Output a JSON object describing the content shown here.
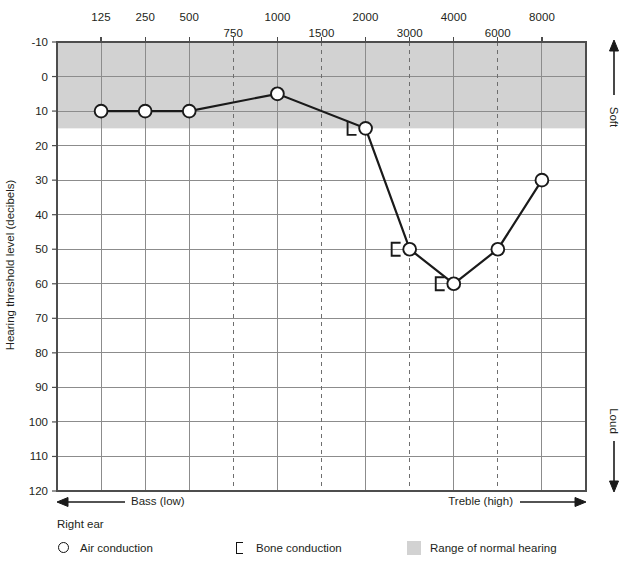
{
  "chart_data": {
    "type": "line",
    "title": "",
    "xlabel": "",
    "ylabel": "Hearing threshold level (decibels)",
    "x_tick_labels_major": [
      "125",
      "250",
      "500",
      "1000",
      "2000",
      "4000",
      "8000"
    ],
    "x_tick_labels_minor": [
      "750",
      "1500",
      "3000",
      "6000"
    ],
    "x_frequencies": [
      125,
      250,
      500,
      750,
      1000,
      1500,
      2000,
      3000,
      4000,
      6000,
      8000
    ],
    "y_tick_labels": [
      "-10",
      "0",
      "10",
      "20",
      "30",
      "40",
      "50",
      "60",
      "70",
      "80",
      "90",
      "100",
      "110",
      "120"
    ],
    "ylim": [
      -10,
      120
    ],
    "y_invert": true,
    "grid": true,
    "normal_hearing_band": {
      "from": -10,
      "to": 15,
      "color": "#d2d2d2"
    },
    "series": [
      {
        "name": "Air conduction",
        "marker": "circle",
        "points": [
          {
            "freq": 125,
            "db": 10
          },
          {
            "freq": 250,
            "db": 10
          },
          {
            "freq": 500,
            "db": 10
          },
          {
            "freq": 1000,
            "db": 5
          },
          {
            "freq": 2000,
            "db": 15
          },
          {
            "freq": 3000,
            "db": 50
          },
          {
            "freq": 4000,
            "db": 60
          },
          {
            "freq": 6000,
            "db": 50
          },
          {
            "freq": 8000,
            "db": 30
          }
        ]
      },
      {
        "name": "Bone conduction",
        "marker": "bracket",
        "points": [
          {
            "freq": 2000,
            "db": 15,
            "style": "corner-right"
          },
          {
            "freq": 3000,
            "db": 50,
            "style": "left"
          },
          {
            "freq": 4000,
            "db": 60,
            "style": "left"
          }
        ]
      }
    ],
    "annotations": {
      "x_left": "Bass (low)",
      "x_right": "Treble (high)",
      "y_top": "Soft",
      "y_bottom": "Loud"
    }
  },
  "legend": {
    "title": "Right ear",
    "items": [
      {
        "label": "Air conduction",
        "symbol": "circle-icon"
      },
      {
        "label": "Bone conduction",
        "symbol": "bracket-icon"
      },
      {
        "label": "Range of normal hearing",
        "symbol": "gray-swatch-icon"
      }
    ]
  },
  "colors": {
    "plot_line": "#1a1a1a",
    "grid": "#8c8c8c",
    "band": "#d2d2d2",
    "frame": "#4d4d4d",
    "text": "#231f20"
  }
}
